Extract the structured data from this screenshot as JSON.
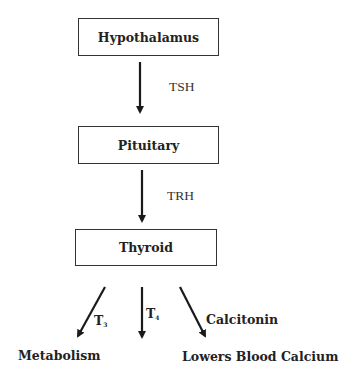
{
  "diagram": {
    "type": "flowchart",
    "nodes": [
      {
        "id": "hypothalamus",
        "label": "Hypothalamus"
      },
      {
        "id": "pituitary",
        "label": "Pituitary"
      },
      {
        "id": "thyroid",
        "label": "Thyroid"
      }
    ],
    "edges": [
      {
        "from": "hypothalamus",
        "to": "pituitary",
        "label": "TSH"
      },
      {
        "from": "pituitary",
        "to": "thyroid",
        "label": "TRH"
      },
      {
        "from": "thyroid",
        "to": "metabolism",
        "label": "T3"
      },
      {
        "from": "thyroid",
        "to": "unlabeled-target",
        "label": "T4"
      },
      {
        "from": "thyroid",
        "to": "lowers-blood-calcium",
        "label": "Calcitonin"
      }
    ],
    "outcomes": {
      "metabolism": "Metabolism",
      "lowers_blood_calcium": "Lowers Blood Calcium"
    },
    "edge_labels": {
      "tsh": "TSH",
      "trh": "TRH",
      "t3_base": "T",
      "t3_sub": "3",
      "t4_base": "T",
      "t4_sub": "4",
      "calcitonin": "Calcitonin"
    },
    "colors": {
      "stroke": "#1a1a1a",
      "box_border": "#333333",
      "background": "#ffffff"
    }
  }
}
